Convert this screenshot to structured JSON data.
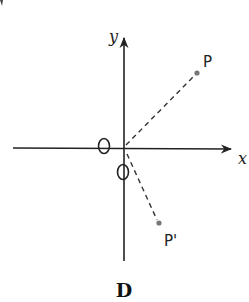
{
  "diagram": {
    "caption": "D",
    "axes": {
      "x_label": "x",
      "y_label": "y",
      "origin_marks": [
        "O",
        "O"
      ]
    },
    "points": [
      {
        "label": "P",
        "x": 197,
        "y": 73
      },
      {
        "label": "P'",
        "x": 159,
        "y": 223
      }
    ],
    "origin": {
      "x": 124,
      "y": 148
    },
    "colors": {
      "stroke": "#222222",
      "point": "#777777"
    }
  }
}
